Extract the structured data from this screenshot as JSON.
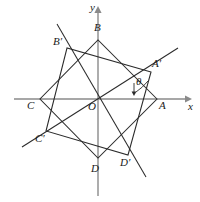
{
  "figure": {
    "type": "geometry-diagram",
    "width": 200,
    "height": 202,
    "stroke_color": "#2b2b2b",
    "axis_color": "#8a8a8a",
    "background": "#ffffff"
  },
  "axes": {
    "x_label": "x",
    "y_label": "y",
    "origin_label": "O",
    "origin": {
      "x": 98,
      "y": 99
    },
    "x_axis": {
      "x1": 14,
      "y1": 99,
      "x2": 190,
      "y2": 99
    },
    "y_axis": {
      "x1": 98,
      "y1": 194,
      "x2": 98,
      "y2": 8
    }
  },
  "angle": {
    "symbol": "θ",
    "vertex": "O",
    "from_ray": "OA",
    "to_ray": "OA'",
    "label_position": {
      "x": 136,
      "y": 82
    }
  },
  "points": [
    {
      "name": "A",
      "label": "A",
      "x": 157,
      "y": 99,
      "label_x": 159,
      "label_y": 102,
      "on_axis": "x"
    },
    {
      "name": "B",
      "label": "B",
      "x": 98,
      "y": 40,
      "label_x": 95,
      "label_y": 24,
      "on_axis": "y"
    },
    {
      "name": "C",
      "label": "C",
      "x": 40,
      "y": 99,
      "label_x": 28,
      "label_y": 102,
      "on_axis": "x"
    },
    {
      "name": "D",
      "label": "D",
      "x": 98,
      "y": 158,
      "label_x": 92,
      "label_y": 166,
      "on_axis": "y"
    },
    {
      "name": "A'",
      "label": "A′",
      "x": 151,
      "y": 72,
      "label_x": 153,
      "label_y": 62,
      "on_axis": "none"
    },
    {
      "name": "B'",
      "label": "B′",
      "x": 67,
      "y": 48,
      "label_x": 55,
      "label_y": 40,
      "on_axis": "none"
    },
    {
      "name": "C'",
      "label": "C′",
      "x": 46,
      "y": 131,
      "label_x": 37,
      "label_y": 136,
      "on_axis": "none"
    },
    {
      "name": "D'",
      "label": "D′",
      "x": 128,
      "y": 155,
      "label_x": 122,
      "label_y": 160,
      "on_axis": "none"
    }
  ],
  "squares": [
    {
      "name": "ABCD",
      "vertices": [
        "A",
        "B",
        "C",
        "D"
      ]
    },
    {
      "name": "A'B'C'D'",
      "vertices": [
        "A'",
        "B'",
        "C'",
        "D'"
      ]
    }
  ],
  "rays": [
    {
      "name": "ray-through-A-prime",
      "from": {
        "x": 98,
        "y": 99
      },
      "to": {
        "x": 178,
        "y": 48
      }
    },
    {
      "name": "ray-through-B-prime",
      "from": {
        "x": 98,
        "y": 99
      },
      "to": {
        "x": 57,
        "y": 24
      }
    },
    {
      "name": "ray-through-C-prime",
      "from": {
        "x": 98,
        "y": 99
      },
      "to": {
        "x": 22,
        "y": 147
      }
    },
    {
      "name": "ray-through-D-prime",
      "from": {
        "x": 98,
        "y": 99
      },
      "to": {
        "x": 146,
        "y": 177
      }
    }
  ]
}
